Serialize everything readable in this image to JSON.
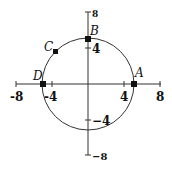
{
  "diagram": {
    "type": "circle-on-coordinate-plane",
    "axes": {
      "x_ticks": [
        {
          "value": -8,
          "label": "-8"
        },
        {
          "value": -4,
          "label": "-4"
        },
        {
          "value": 4,
          "label": "4"
        },
        {
          "value": 8,
          "label": "8"
        }
      ],
      "y_ticks": [
        {
          "value": 8,
          "label": "8"
        },
        {
          "value": 4,
          "label": "4"
        },
        {
          "value": -4,
          "label": "−4"
        },
        {
          "value": -8,
          "label": "−8"
        }
      ]
    },
    "circle": {
      "center": [
        0,
        0
      ],
      "radius": 5
    },
    "points": [
      {
        "name": "A",
        "label": "A",
        "x": 5,
        "y": 0
      },
      {
        "name": "B",
        "label": "B",
        "x": 0,
        "y": 5
      },
      {
        "name": "C",
        "label": "C",
        "x": -3.5,
        "y": 3.5
      },
      {
        "name": "D",
        "label": "D",
        "x": -5,
        "y": 0
      }
    ],
    "colors": {
      "stroke": "#333333",
      "point": "#111111",
      "background": "#ffffff"
    }
  }
}
